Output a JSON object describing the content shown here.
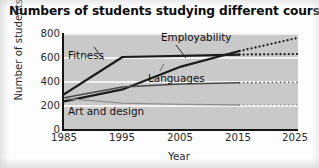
{
  "chart_data": {
    "type": "line",
    "title": "Numbers of students studying different courses",
    "xlabel": "Year",
    "ylabel": "Number of students",
    "xlim": [
      1985,
      2025
    ],
    "ylim": [
      0,
      800
    ],
    "ytick_labels": [
      "800",
      "600",
      "400",
      "200",
      "0"
    ],
    "ytick_values": [
      800,
      600,
      400,
      200,
      0
    ],
    "xtick_labels": [
      "1985",
      "1995",
      "2005",
      "2015",
      "2025"
    ],
    "xtick_values": [
      1985,
      1995,
      2005,
      2015,
      2025
    ],
    "grid": "horizontal",
    "legend": "inline-labels",
    "projection_note": "Dotted segments from 2015 to 2025 are projections",
    "series": [
      {
        "name": "Employability",
        "label": "Employability",
        "color": "#1c1c1c",
        "x": [
          1985,
          1995,
          2005,
          2015,
          2025
        ],
        "values": [
          230,
          330,
          520,
          650,
          760
        ],
        "solid_until": 2015,
        "dashed_from": 2015
      },
      {
        "name": "Fitness",
        "label": "Fitness",
        "color": "#1c1c1c",
        "x": [
          1985,
          1995,
          2005,
          2015,
          2025
        ],
        "values": [
          290,
          600,
          610,
          620,
          625
        ],
        "solid_until": 2015,
        "dashed_from": 2015
      },
      {
        "name": "Languages",
        "label": "Languages",
        "color": "#4a4a4a",
        "x": [
          1985,
          1995,
          2005,
          2015,
          2025
        ],
        "values": [
          260,
          350,
          375,
          385,
          390
        ],
        "solid_until": 2015,
        "dashed_from": 2015
      },
      {
        "name": "Art and design",
        "label": "Art and design",
        "color": "#8f8f8f",
        "x": [
          1985,
          1995,
          2005,
          2015,
          2025
        ],
        "values": [
          255,
          215,
          205,
          200,
          200
        ],
        "solid_until": 2015,
        "dashed_from": 2015
      }
    ],
    "colors": {
      "plot_background": "#c9c9c9",
      "gridline": "#f2f2f2",
      "axis": "#151515",
      "text": "#1a1a1a"
    }
  }
}
